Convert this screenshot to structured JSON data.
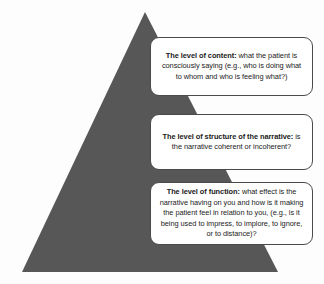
{
  "figure": {
    "background_color": "#fdfdfd",
    "pyramid": {
      "name": "pyramid-shape",
      "fill_color": "#575757",
      "apex": "145,12",
      "base_left": "22,272",
      "base_right": "278,272"
    },
    "callouts": [
      {
        "id": "content",
        "lead": "The level of content:",
        "body": " what the patient is consciously saying (e.g., who is doing what to whom and who is feeling what?)"
      },
      {
        "id": "structure",
        "lead": "The level of structure of the narrative:",
        "body": " is the narrative coherent or incoherent?"
      },
      {
        "id": "function",
        "lead": "The level of function:",
        "body": " what effect is the narrative having on you and how is it making the patient feel in relation to you, (e.g., is it being used to impress, to implore, to ignore, or to distance)?"
      }
    ]
  }
}
